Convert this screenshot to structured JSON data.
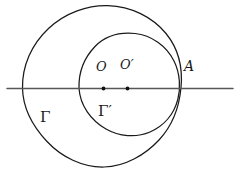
{
  "figure": {
    "kind": "geometry-diagram",
    "canvas": {
      "width": 244,
      "height": 179,
      "background": "#ffffff"
    },
    "stroke": {
      "curve_color": "#1a1a1a",
      "line_color": "#555555",
      "point_color": "#111111"
    },
    "labels": {
      "center_big": "O",
      "center_small": "O′",
      "tangency_point": "A",
      "circle_big": "Γ",
      "circle_small": "Γ′"
    },
    "elements": {
      "circle_big": {
        "cx": 102,
        "cy": 87,
        "r": 80,
        "label": "Γ"
      },
      "circle_small": {
        "cx": 128,
        "cy": 87,
        "r": 50,
        "label": "Γ′"
      },
      "axis_line": {
        "x1": 7,
        "y1": 88,
        "x2": 233,
        "y2": 88
      },
      "point_O": {
        "x": 103,
        "y": 88
      },
      "point_Oprime": {
        "x": 127,
        "y": 88
      },
      "point_A": {
        "x": 178,
        "y": 88
      }
    }
  }
}
